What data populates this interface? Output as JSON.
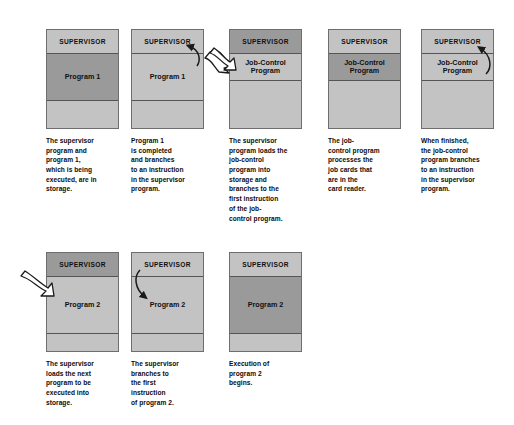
{
  "figure": {
    "title": "",
    "labels": {
      "supervisor": "SUPERVISOR",
      "program1": "Program 1",
      "program2": "Program 2",
      "job_control": "Job-Control\nProgram",
      "empty": ""
    },
    "colors": {
      "box_fill_light": "#c3c3c3",
      "box_fill_active": "#9a9a9a",
      "box_border": "#6e6e6e",
      "segment_divider": "#555555",
      "text": "#0c0c0c",
      "arrow": "#1a1a1a",
      "page_background": "#ffffff"
    },
    "steps": [
      {
        "id": "step-1",
        "row": 1,
        "segments": [
          {
            "name": "supervisor",
            "label": "SUPERVISOR",
            "state": "idle"
          },
          {
            "name": "program",
            "label": "Program 1",
            "state": "active"
          },
          {
            "name": "free",
            "label": "",
            "state": "idle"
          }
        ],
        "caption": "The supervisor\nprogram and\nprogram 1,\nwhich is being\nexecuted, are in\nstorage.",
        "arrows": []
      },
      {
        "id": "step-2",
        "row": 1,
        "segments": [
          {
            "name": "supervisor",
            "label": "SUPERVISOR",
            "state": "idle"
          },
          {
            "name": "program",
            "label": "Program 1",
            "state": "idle"
          },
          {
            "name": "free",
            "label": "",
            "state": "idle"
          }
        ],
        "caption": "Program 1\nis completed\nand branches\nto an instruction\nin the supervisor\nprogram.",
        "arrows": [
          "branch-up-to-supervisor",
          "transfer-right"
        ]
      },
      {
        "id": "step-3",
        "row": 1,
        "segments": [
          {
            "name": "supervisor",
            "label": "SUPERVISOR",
            "state": "active"
          },
          {
            "name": "program",
            "label": "Job-Control\nProgram",
            "state": "idle"
          },
          {
            "name": "free",
            "label": "",
            "state": "idle"
          }
        ],
        "caption": "The supervisor\nprogram loads the\njob-control\nprogram into\nstorage and\nbranches to the\nfirst instruction\nof the job-\ncontrol program.",
        "arrows": [
          "load-in-from-left"
        ]
      },
      {
        "id": "step-4",
        "row": 1,
        "segments": [
          {
            "name": "supervisor",
            "label": "SUPERVISOR",
            "state": "idle"
          },
          {
            "name": "program",
            "label": "Job-Control\nProgram",
            "state": "active"
          },
          {
            "name": "free",
            "label": "",
            "state": "idle"
          }
        ],
        "caption": "The job-\ncontrol program\nprocesses the\njob cards that\nare in the\ncard reader.",
        "arrows": []
      },
      {
        "id": "step-5",
        "row": 1,
        "segments": [
          {
            "name": "supervisor",
            "label": "SUPERVISOR",
            "state": "idle"
          },
          {
            "name": "program",
            "label": "Job-Control\nProgram",
            "state": "idle"
          },
          {
            "name": "free",
            "label": "",
            "state": "idle"
          }
        ],
        "caption": "When finished,\nthe job-control\nprogram branches\nto an instruction\nin the supervisor\nprogram.",
        "arrows": [
          "branch-up-to-supervisor"
        ]
      },
      {
        "id": "step-6",
        "row": 2,
        "segments": [
          {
            "name": "supervisor",
            "label": "SUPERVISOR",
            "state": "active"
          },
          {
            "name": "program",
            "label": "Program 2",
            "state": "idle"
          },
          {
            "name": "free",
            "label": "",
            "state": "idle"
          }
        ],
        "caption": "The supervisor\nloads the next\nprogram to be\nexecuted into\nstorage.",
        "arrows": [
          "load-in-from-left"
        ]
      },
      {
        "id": "step-7",
        "row": 2,
        "segments": [
          {
            "name": "supervisor",
            "label": "SUPERVISOR",
            "state": "idle"
          },
          {
            "name": "program",
            "label": "Program 2",
            "state": "idle"
          },
          {
            "name": "free",
            "label": "",
            "state": "idle"
          }
        ],
        "caption": "The supervisor\nbranches to\nthe first\ninstruction\nof program 2.",
        "arrows": [
          "branch-down-to-program"
        ]
      },
      {
        "id": "step-8",
        "row": 2,
        "segments": [
          {
            "name": "supervisor",
            "label": "SUPERVISOR",
            "state": "idle"
          },
          {
            "name": "program",
            "label": "Program 2",
            "state": "active"
          },
          {
            "name": "free",
            "label": "",
            "state": "idle"
          }
        ],
        "caption": "Execution of\nprogram 2\nbegins.",
        "arrows": []
      }
    ]
  }
}
